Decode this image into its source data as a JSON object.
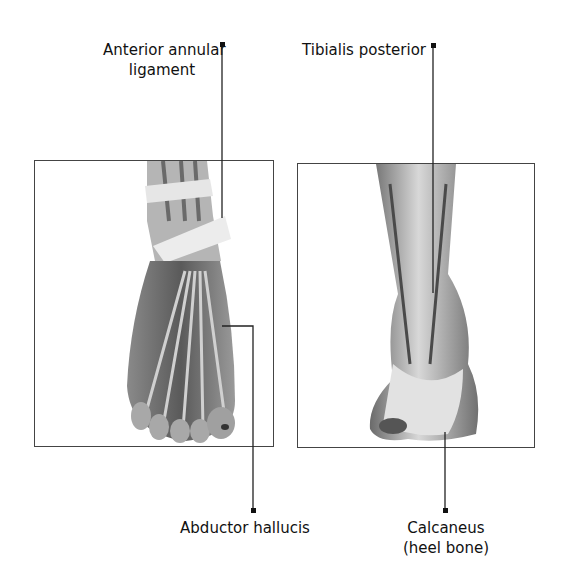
{
  "labels": {
    "anterior_annular_ligament": "Anterior annular\nligament",
    "anterior_line1": "Anterior annular",
    "anterior_line2": "ligament",
    "tibialis_posterior": "Tibialis posterior",
    "abductor_hallucis": "Abductor hallucis",
    "calcaneus_line1": "Calcaneus",
    "calcaneus_line2": "(heel bone)"
  },
  "panels": {
    "left": {
      "subject": "foot-top-view",
      "description": "Dorsal view of foot showing tendons and ligaments"
    },
    "right": {
      "subject": "ankle-rear-view",
      "description": "Posterior view of lower leg and heel"
    }
  },
  "colors": {
    "line": "#222222",
    "border": "#444444",
    "background": "#ffffff"
  }
}
